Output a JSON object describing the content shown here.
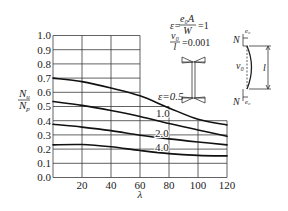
{
  "chart_data": {
    "type": "line",
    "title": "",
    "xlabel": "λ",
    "ylabel": {
      "numerator": "N",
      "numerator_sub": "u",
      "denominator": "N",
      "denominator_sub": "p"
    },
    "xlim": [
      0,
      120
    ],
    "ylim": [
      0,
      1.0
    ],
    "x_ticks": [
      "20",
      "40",
      "60",
      "80",
      "100",
      "120"
    ],
    "x_tick_values": [
      20,
      40,
      60,
      80,
      100,
      120
    ],
    "y_ticks": [
      "0.0",
      "0.1",
      "0.2",
      "0.3",
      "0.4",
      "0.5",
      "0.6",
      "0.7",
      "0.8",
      "0.9",
      "1.0"
    ],
    "y_tick_values": [
      0,
      0.1,
      0.2,
      0.3,
      0.4,
      0.5,
      0.6,
      0.7,
      0.8,
      0.9,
      1.0
    ],
    "grid": true,
    "legend": "inline-labels",
    "x": [
      0,
      20,
      40,
      60,
      80,
      100,
      120
    ],
    "series": [
      {
        "name": "ε=0.5",
        "label": "ε=0.5",
        "values": [
          0.7,
          0.675,
          0.63,
          0.575,
          0.49,
          0.41,
          0.37
        ]
      },
      {
        "name": "ε=1.0",
        "label": "1.0",
        "values": [
          0.535,
          0.508,
          0.472,
          0.43,
          0.38,
          0.335,
          0.29
        ]
      },
      {
        "name": "ε=2.0",
        "label": "2.0",
        "values": [
          0.375,
          0.355,
          0.33,
          0.298,
          0.272,
          0.25,
          0.23
        ]
      },
      {
        "name": "ε=4.0",
        "label": "4.0",
        "values": [
          0.23,
          0.232,
          0.216,
          0.19,
          0.168,
          0.156,
          0.152
        ]
      }
    ],
    "annotations": {
      "formula1": {
        "lhs": "ε=",
        "numerator": "e₀A",
        "denominator": "W",
        "rhs": "=1"
      },
      "formula2": {
        "numerator": "v₀",
        "denominator": "l",
        "rhs": "=0.001"
      },
      "column_diagram": {
        "top_force": "N",
        "top_ecc": "e₀",
        "bow_label": "v₀",
        "length_label": "l",
        "bottom_force": "N",
        "bottom_ecc": "e₀"
      }
    }
  }
}
